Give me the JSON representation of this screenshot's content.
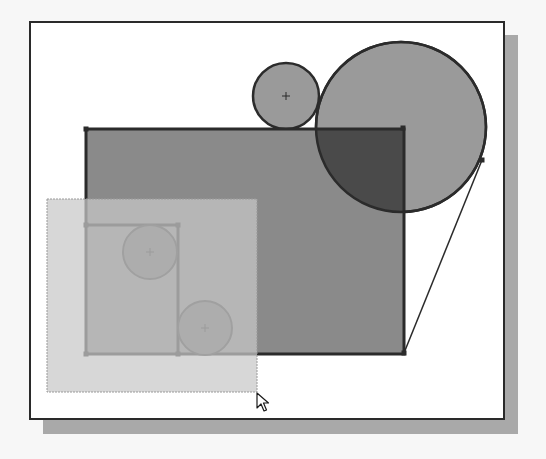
{
  "viewport": {
    "background": "#f7f7f7",
    "frame": {
      "x": 30,
      "y": 22,
      "width": 474,
      "height": 397,
      "fill": "#ffffff",
      "stroke": "#2a2a2a",
      "stroke_width": 2
    },
    "shadow": {
      "x": 43,
      "y": 35,
      "width": 475,
      "height": 399,
      "fill": "#a9a9a9"
    }
  },
  "sketch": {
    "main_rectangle": {
      "x": 86,
      "y": 129,
      "width": 318,
      "height": 225,
      "fill": "#8a8a8a",
      "stroke": "#2b2b2b",
      "stroke_width": 3
    },
    "inner_rectangle": {
      "x1": 86,
      "y1": 225,
      "x2": 178,
      "y2": 354,
      "stroke": "#2b2b2b",
      "stroke_width": 3
    },
    "top_small_circle": {
      "cx": 286,
      "cy": 96,
      "r": 33,
      "fill": "#9a9a9a",
      "stroke": "#2b2b2b",
      "stroke_width": 2.5
    },
    "large_circle": {
      "cx": 401,
      "cy": 127,
      "r": 85,
      "fill": "#9a9a9a",
      "stroke": "#2b2b2b",
      "stroke_width": 2.5
    },
    "overlap_region": {
      "fill": "#4a4a4a"
    },
    "inner_circle_upper": {
      "cx": 150,
      "cy": 252,
      "r": 27,
      "fill": "#6a6a6a",
      "stroke": "#3a3a3a",
      "stroke_width": 2
    },
    "inner_circle_lower": {
      "cx": 205,
      "cy": 328,
      "r": 27,
      "fill": "#6a6a6a",
      "stroke": "#3a3a3a",
      "stroke_width": 2
    },
    "tangent_line": {
      "x1": 404,
      "y1": 353,
      "x2": 482,
      "y2": 160,
      "stroke": "#2b2b2b",
      "stroke_width": 1.5
    },
    "endpoints": [
      {
        "x": 86,
        "y": 129
      },
      {
        "x": 403,
        "y": 128
      },
      {
        "x": 404,
        "y": 353
      },
      {
        "x": 86,
        "y": 354
      },
      {
        "x": 86,
        "y": 225
      },
      {
        "x": 178,
        "y": 225
      },
      {
        "x": 178,
        "y": 354
      },
      {
        "x": 482,
        "y": 160
      }
    ],
    "center_marks": [
      {
        "x": 286,
        "y": 96
      },
      {
        "x": 150,
        "y": 252
      },
      {
        "x": 205,
        "y": 328
      }
    ]
  },
  "selection_window": {
    "x": 47,
    "y": 199,
    "width": 210,
    "height": 193,
    "fill": "#c8c8c8",
    "opacity": 0.72,
    "stroke": "#9a9a9a"
  },
  "cursor": {
    "x": 257,
    "y": 393,
    "icon": "arrow-pointer-icon"
  }
}
